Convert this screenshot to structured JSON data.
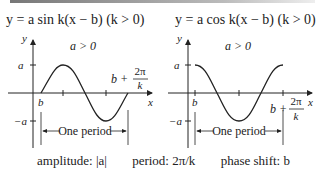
{
  "left": {
    "equation": "y = a sin k(x − b)   (k > 0)",
    "condition": "a > 0",
    "axis_y": "y",
    "axis_x": "x",
    "label_a": "a",
    "label_neg_a": "−a",
    "label_b": "b",
    "label_end_b": "b +",
    "label_end_num": "2π",
    "label_end_den": "k",
    "period_label": "One period"
  },
  "right": {
    "equation": "y = a cos k(x − b)   (k > 0)",
    "condition": "a > 0",
    "axis_y": "y",
    "axis_x": "x",
    "label_a": "a",
    "label_neg_a": "−a",
    "label_b": "b",
    "label_end_b": "b +",
    "label_end_num": "2π",
    "label_end_den": "k",
    "period_label": "One period"
  },
  "caption": {
    "amplitude": "amplitude: |a|",
    "period": "period: 2π/k",
    "phase_shift": "phase shift: b"
  }
}
